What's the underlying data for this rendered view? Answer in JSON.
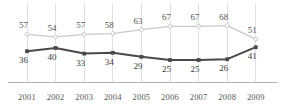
{
  "chart_data": {
    "type": "line",
    "title": "",
    "subtitle": "",
    "xlabel": "",
    "ylabel": "",
    "categories": [
      "2001",
      "2002",
      "2003",
      "2004",
      "2005",
      "2006",
      "2007",
      "2008",
      "2009"
    ],
    "series": [
      {
        "name": "upper-series",
        "values": [
          57,
          54,
          57,
          58,
          63,
          67,
          67,
          68,
          51
        ],
        "color": "#c9c9c9",
        "marker": "open-circle",
        "label_position": "above"
      },
      {
        "name": "lower-series",
        "values": [
          36,
          40,
          33,
          34,
          29,
          25,
          25,
          26,
          41
        ],
        "color": "#4a4a4a",
        "marker": "filled-square",
        "label_position": "below"
      }
    ],
    "ylim": [
      0,
      100
    ],
    "xlim": [
      "2001",
      "2009"
    ],
    "grid": {
      "vertical": true,
      "horizontal": false,
      "color": "#d9d9d9"
    },
    "axis": {
      "baseline_color": "#b3b3b3",
      "y_axis_labels_visible": false
    },
    "legend": {
      "visible": false,
      "position": "none"
    },
    "data_labels_visible": true
  },
  "axis_ticks": {
    "x": [
      "2001",
      "2002",
      "2003",
      "2004",
      "2005",
      "2006",
      "2007",
      "2008",
      "2009"
    ]
  },
  "colors": {
    "upper_series": "#c9c9c9",
    "lower_series": "#4a4a4a",
    "gridline": "#d9d9d9",
    "baseline": "#b3b3b3",
    "label_text": "#4a4a4a",
    "tick_text": "#555555",
    "background": "#ffffff"
  }
}
